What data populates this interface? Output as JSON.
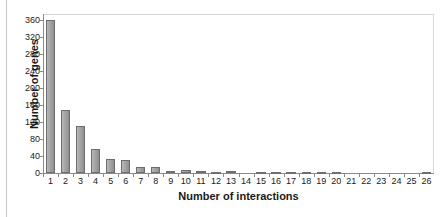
{
  "chart_data": {
    "type": "bar",
    "title": "",
    "xlabel": "Number of interactions",
    "ylabel": "Number of genes",
    "categories": [
      "1",
      "2",
      "3",
      "4",
      "5",
      "6",
      "7",
      "8",
      "9",
      "10",
      "11",
      "12",
      "13",
      "14",
      "15",
      "16",
      "17",
      "18",
      "19",
      "20",
      "21",
      "22",
      "23",
      "24",
      "25",
      "26"
    ],
    "values": [
      362,
      148,
      110,
      57,
      33,
      31,
      14,
      14,
      5,
      6,
      4,
      1,
      5,
      0,
      2,
      2,
      1,
      1,
      1,
      2,
      0,
      0,
      0,
      0,
      0,
      1
    ],
    "ylim": [
      0,
      375
    ],
    "yticks": [
      0,
      40,
      80,
      120,
      160,
      200,
      240,
      280,
      320,
      360
    ],
    "ytick_labels": [
      "0",
      "40",
      "80",
      "120",
      "160",
      "200",
      "240",
      "280",
      "320",
      "360"
    ],
    "grid": false,
    "legend": "none",
    "bar_color": "#a8a8a8",
    "bar_edge_color": "#6e6e6e",
    "axis_color": "#8a8a8a",
    "frame_color": "#d6d6d6",
    "background": "#ffffff",
    "text_color": "#1a1a1a"
  }
}
